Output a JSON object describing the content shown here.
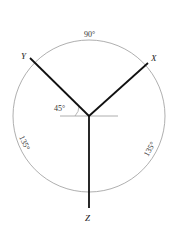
{
  "diagram": {
    "type": "isometric-axes-angle-diagram",
    "center": {
      "x": 89,
      "y": 116
    },
    "circle_radius": 76,
    "axes": [
      {
        "name": "X",
        "label": "X",
        "end": {
          "x": 148,
          "y": 63
        },
        "label_pos": {
          "x": 153,
          "y": 59
        }
      },
      {
        "name": "Y",
        "label": "Y",
        "end": {
          "x": 30,
          "y": 58
        },
        "label_pos": {
          "x": 23,
          "y": 55
        }
      },
      {
        "name": "Z",
        "label": "Z",
        "end": {
          "x": 89,
          "y": 208
        },
        "label_pos": {
          "x": 86,
          "y": 220
        }
      }
    ],
    "reference_line": {
      "x1": 60,
      "y1": 116,
      "x2": 118,
      "y2": 116
    },
    "angle_labels": {
      "top": "90°",
      "left": "135°",
      "right": "135°",
      "reference": "45°"
    },
    "colors": {
      "axis": "#111111",
      "circle": "#9a9a9a",
      "reference": "#9a9a9a"
    }
  }
}
